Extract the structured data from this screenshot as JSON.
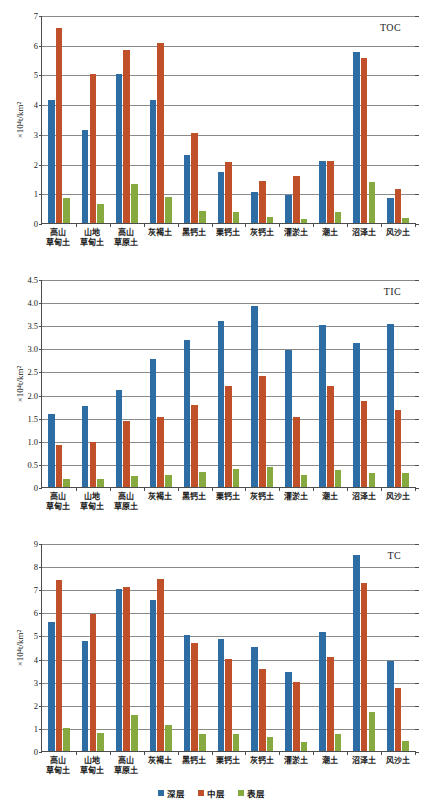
{
  "ylabel": "×10⁴t/km²",
  "colors": {
    "deep": "#2e6da4",
    "middle": "#c0502a",
    "surface": "#86a940",
    "axis": "#4c4c4c",
    "grid": "#8a8a8a"
  },
  "legend": [
    {
      "label": "深层",
      "color": "#2e6da4",
      "key": "deep"
    },
    {
      "label": "中层",
      "color": "#c0502a",
      "key": "middle"
    },
    {
      "label": "表层",
      "color": "#86a940",
      "key": "surface"
    }
  ],
  "categories": [
    "高山\n草甸土",
    "山地\n草甸土",
    "高山\n草原土",
    "灰褐土",
    "黑钙土",
    "栗钙土",
    "灰钙土",
    "灌淤土",
    "潮土",
    "沼泽土",
    "风沙土"
  ],
  "chart_data": [
    {
      "type": "bar",
      "title": "TOC",
      "xlabel": "",
      "ylabel": "×10⁴t/km²",
      "ylim": [
        0,
        7
      ],
      "yticks": [
        "0",
        "1",
        "2",
        "3",
        "4",
        "5",
        "6",
        "7"
      ],
      "grid": true,
      "legend_position": "bottom",
      "categories": [
        "高山草甸土",
        "山地草甸土",
        "高山草原土",
        "灰褐土",
        "黑钙土",
        "栗钙土",
        "灰钙土",
        "灌淤土",
        "潮土",
        "沼泽土",
        "风沙土"
      ],
      "series": [
        {
          "name": "深层",
          "values": [
            4.15,
            3.14,
            5.02,
            4.15,
            2.29,
            1.72,
            1.06,
            0.93,
            2.09,
            5.74,
            0.85
          ]
        },
        {
          "name": "中层",
          "values": [
            6.57,
            5.01,
            5.83,
            6.07,
            3.04,
            2.05,
            1.41,
            1.59,
            2.08,
            5.56,
            1.16
          ]
        },
        {
          "name": "表层",
          "values": [
            0.84,
            0.63,
            1.32,
            0.86,
            0.42,
            0.37,
            0.2,
            0.14,
            0.37,
            1.37,
            0.16
          ]
        }
      ]
    },
    {
      "type": "bar",
      "title": "TIC",
      "xlabel": "",
      "ylabel": "×10⁴t/km²",
      "ylim": [
        0,
        4.5
      ],
      "yticks": [
        "0",
        "0.5",
        "1.0",
        "1.5",
        "2.0",
        "2.5",
        "3.0",
        "3.5",
        "4.0",
        "4.5"
      ],
      "grid": true,
      "legend_position": "bottom",
      "categories": [
        "高山草甸土",
        "山地草甸土",
        "高山草原土",
        "灰褐土",
        "黑钙土",
        "栗钙土",
        "灰钙土",
        "灌淤土",
        "潮土",
        "沼泽土",
        "风沙土"
      ],
      "series": [
        {
          "name": "深层",
          "values": [
            1.57,
            1.76,
            2.09,
            2.76,
            3.18,
            3.6,
            3.91,
            2.96,
            3.51,
            3.12,
            3.52
          ]
        },
        {
          "name": "中层",
          "values": [
            0.91,
            0.97,
            1.43,
            1.51,
            1.77,
            2.19,
            2.4,
            1.52,
            2.18,
            1.87,
            1.66
          ]
        },
        {
          "name": "表层",
          "values": [
            0.18,
            0.18,
            0.24,
            0.27,
            0.32,
            0.38,
            0.44,
            0.27,
            0.37,
            0.31,
            0.3
          ]
        }
      ]
    },
    {
      "type": "bar",
      "title": "TC",
      "xlabel": "",
      "ylabel": "×10⁴t/km²",
      "ylim": [
        0,
        9
      ],
      "yticks": [
        "0",
        "1",
        "2",
        "3",
        "4",
        "5",
        "6",
        "7",
        "8",
        "9"
      ],
      "grid": true,
      "legend_position": "bottom",
      "categories": [
        "高山草甸土",
        "山地草甸土",
        "高山草原土",
        "灰褐土",
        "黑钙土",
        "栗钙土",
        "灰钙土",
        "灌淤土",
        "潮土",
        "沼泽土",
        "风沙土"
      ],
      "series": [
        {
          "name": "深层",
          "values": [
            5.58,
            4.78,
            7.02,
            6.52,
            5.03,
            4.86,
            4.48,
            3.44,
            5.15,
            8.48,
            3.9
          ]
        },
        {
          "name": "中层",
          "values": [
            7.42,
            5.91,
            7.1,
            7.44,
            4.67,
            4.0,
            3.55,
            3.0,
            4.07,
            7.25,
            2.71
          ]
        },
        {
          "name": "表层",
          "values": [
            1.0,
            0.8,
            1.58,
            1.12,
            0.73,
            0.72,
            0.61,
            0.41,
            0.74,
            1.69,
            0.45
          ]
        }
      ]
    }
  ]
}
